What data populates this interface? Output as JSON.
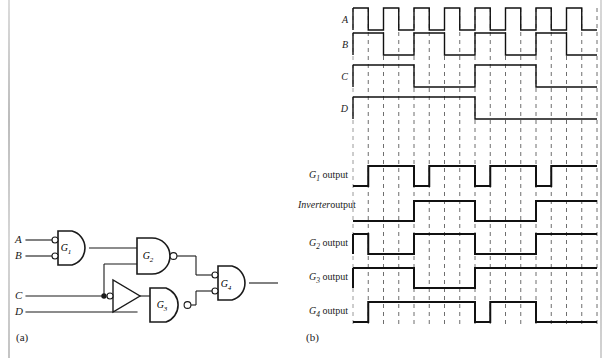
{
  "figure": {
    "panel_a_caption": "(a)",
    "panel_b_caption": "(b)"
  },
  "circuit": {
    "inputs": [
      {
        "name": "A",
        "label": "A"
      },
      {
        "name": "B",
        "label": "B"
      },
      {
        "name": "C",
        "label": "C"
      },
      {
        "name": "D",
        "label": "D"
      }
    ],
    "gates": [
      {
        "id": "G1",
        "label": "G",
        "sub": "1",
        "type": "and-with-inverted-inputs",
        "inputs": [
          "A",
          "B"
        ]
      },
      {
        "id": "G2",
        "label": "G",
        "sub": "2",
        "type": "nand",
        "inputs": [
          "G1",
          "C"
        ]
      },
      {
        "id": "G3",
        "label": "G",
        "sub": "3",
        "type": "nand",
        "inputs": [
          "Inverter",
          "D"
        ]
      },
      {
        "id": "G4",
        "label": "G",
        "sub": "4",
        "type": "and-with-inverted-inputs",
        "inputs": [
          "G2",
          "G3"
        ]
      },
      {
        "id": "INV",
        "label": "",
        "type": "inverter",
        "inputs": [
          "C"
        ]
      }
    ],
    "junction_node": "C-branch-dot"
  },
  "timing": {
    "slots": 16,
    "row_labels": [
      {
        "name": "A",
        "text": "A",
        "sub": "",
        "italic": true
      },
      {
        "name": "B",
        "text": "B",
        "sub": "",
        "italic": true
      },
      {
        "name": "C",
        "text": "C",
        "sub": "",
        "italic": true
      },
      {
        "name": "D",
        "text": "D",
        "sub": "",
        "italic": true
      },
      {
        "name": "G1-output",
        "text": "G",
        "sub": "1",
        "suffix": " output"
      },
      {
        "name": "inverter-output",
        "text": "Inverter",
        "sub": "",
        "suffix": "output"
      },
      {
        "name": "G2-output",
        "text": "G",
        "sub": "2",
        "suffix": " output"
      },
      {
        "name": "G3-output",
        "text": "G",
        "sub": "3",
        "suffix": " output"
      },
      {
        "name": "G4-output",
        "text": "G",
        "sub": "4",
        "suffix": " output"
      }
    ]
  },
  "chart_data": {
    "type": "line",
    "xlabel": "",
    "ylabel": "",
    "slots": 16,
    "x": [
      0,
      1,
      2,
      3,
      4,
      5,
      6,
      7,
      8,
      9,
      10,
      11,
      12,
      13,
      14,
      15
    ],
    "series": [
      {
        "name": "A",
        "label": "A",
        "values": [
          1,
          0,
          1,
          0,
          1,
          0,
          1,
          0,
          1,
          0,
          1,
          0,
          1,
          0,
          1,
          0
        ]
      },
      {
        "name": "B",
        "label": "B",
        "values": [
          1,
          1,
          0,
          0,
          1,
          1,
          0,
          0,
          1,
          1,
          0,
          0,
          1,
          1,
          0,
          0
        ]
      },
      {
        "name": "C",
        "label": "C",
        "values": [
          1,
          1,
          1,
          1,
          0,
          0,
          0,
          0,
          1,
          1,
          1,
          1,
          0,
          0,
          0,
          0
        ]
      },
      {
        "name": "D",
        "label": "D",
        "values": [
          1,
          1,
          1,
          1,
          1,
          1,
          1,
          1,
          0,
          0,
          0,
          0,
          0,
          0,
          0,
          0
        ]
      },
      {
        "name": "G1 output",
        "label": "G1 output",
        "values": [
          0,
          1,
          1,
          1,
          0,
          1,
          1,
          1,
          0,
          1,
          1,
          1,
          0,
          1,
          1,
          1
        ]
      },
      {
        "name": "Inverter output",
        "label": "Inverter output",
        "values": [
          0,
          0,
          0,
          0,
          1,
          1,
          1,
          1,
          0,
          0,
          0,
          0,
          1,
          1,
          1,
          1
        ]
      },
      {
        "name": "G2 output",
        "label": "G2 output",
        "values": [
          1,
          0,
          0,
          0,
          1,
          1,
          1,
          1,
          0,
          0,
          0,
          0,
          1,
          1,
          1,
          1
        ]
      },
      {
        "name": "G3 output",
        "label": "G3 output",
        "values": [
          1,
          1,
          1,
          1,
          0,
          0,
          0,
          0,
          1,
          1,
          1,
          1,
          1,
          1,
          1,
          1
        ]
      },
      {
        "name": "G4 output",
        "label": "G4 output",
        "values": [
          0,
          1,
          1,
          1,
          1,
          1,
          1,
          1,
          0,
          1,
          1,
          1,
          0,
          0,
          0,
          0
        ]
      }
    ],
    "gridlines": "dashed-vertical-every-slot",
    "legend": "none"
  }
}
